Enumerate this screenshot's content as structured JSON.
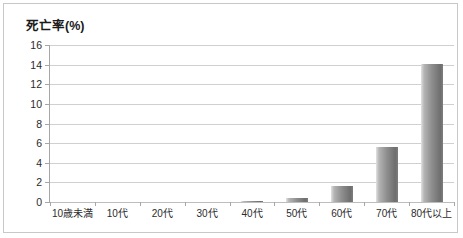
{
  "chart_data": {
    "type": "bar",
    "title": "死亡率(%)",
    "xlabel": "",
    "ylabel": "",
    "ylim": [
      0,
      16
    ],
    "ytick_step": 2,
    "yticks": [
      16,
      14,
      12,
      10,
      8,
      6,
      4,
      2,
      0
    ],
    "grid": true,
    "legend": "none",
    "categories": [
      "10歳未満",
      "10代",
      "20代",
      "30代",
      "40代",
      "50代",
      "60代",
      "70代",
      "80代以上"
    ],
    "values": [
      0,
      0,
      0,
      0,
      0.1,
      0.4,
      1.6,
      5.6,
      14.1
    ],
    "bar_color": "#8f8f8f",
    "grid_color": "#d0d0d0",
    "axis_color": "#a6a6a6",
    "border_color": "#c8c8c8",
    "text_color": "#2b2b2b"
  }
}
